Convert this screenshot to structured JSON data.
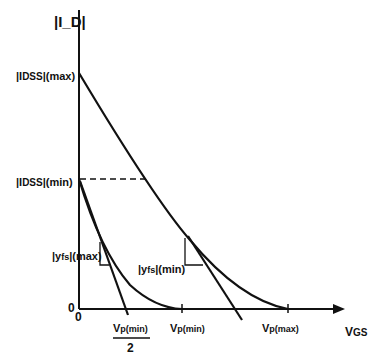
{
  "diagram": {
    "y_axis_label": "|I_D|",
    "x_axis_label": "V_GS",
    "origin_labels": [
      "0",
      "0"
    ],
    "y_ticks": [
      {
        "id": "idss_max",
        "main": "|I",
        "sub": "DSS",
        "suffix": "|(max)"
      },
      {
        "id": "idss_min",
        "main": "|I",
        "sub": "DSS",
        "suffix": "|(min)"
      }
    ],
    "x_ticks": [
      {
        "id": "vp_min_half",
        "main": "V",
        "sub": "p(min)",
        "denominator": "2"
      },
      {
        "id": "vp_min",
        "main": "V",
        "sub": "p(min)"
      },
      {
        "id": "vp_max",
        "main": "V",
        "sub": "p(max)"
      }
    ],
    "annotations": [
      {
        "id": "yfs_max",
        "main": "|y",
        "sub": "fs",
        "suffix": "|(max)"
      },
      {
        "id": "yfs_min",
        "main": "|y",
        "sub": "fs",
        "suffix": "|(min)"
      }
    ],
    "stroke_color": "#111111"
  }
}
